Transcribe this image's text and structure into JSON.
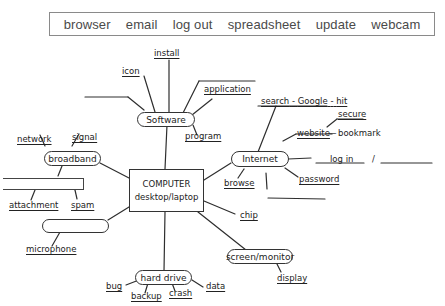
{
  "word_box": {
    "words": [
      "browser",
      "email",
      "log out",
      "spreadsheet",
      "update",
      "webcam"
    ]
  },
  "center": {
    "line1": "COMPUTER",
    "line2": "desktop/laptop"
  },
  "nodes": {
    "software": "Software",
    "broadband": "broadband",
    "internet": "Internet",
    "hard_drive": "hard drive",
    "screen": "screen/monitor"
  },
  "labels": {
    "install": "install",
    "icon": "icon",
    "application": "application",
    "program": "program",
    "network": "network",
    "signal": "signal",
    "attachment": "attachment",
    "spam": "spam",
    "microphone": "microphone",
    "search": "search",
    "dash1": "-",
    "google": "Google",
    "dash2": "-",
    "hit": "hit",
    "secure": "secure",
    "website": "website",
    "bookmark_dash": "—",
    "bookmark": "bookmark",
    "log_in": "log in",
    "slash": "/",
    "browse": "browse",
    "password": "password",
    "chip": "chip",
    "bug": "bug",
    "backup": "backup",
    "crash": "crash",
    "data": "data",
    "display": "display"
  }
}
